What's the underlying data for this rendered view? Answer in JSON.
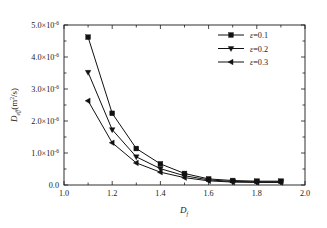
{
  "chart_data": {
    "type": "line",
    "title": "",
    "xlabel": "D_f",
    "ylabel": "D_eff(m^2/s)",
    "xlim": [
      1.0,
      2.0
    ],
    "ylim": [
      0.0,
      5e-06
    ],
    "grid": false,
    "legend_position": "top-right",
    "x": [
      1.1,
      1.2,
      1.3,
      1.4,
      1.5,
      1.6,
      1.7,
      1.8,
      1.9
    ],
    "xticks": [
      "1.0",
      "1.2",
      "1.4",
      "1.6",
      "1.8",
      "2.0"
    ],
    "xtick_values": [
      1.0,
      1.2,
      1.4,
      1.6,
      1.8,
      2.0
    ],
    "ytick_values": [
      0.0,
      1e-06,
      2e-06,
      3e-06,
      4e-06,
      5e-06
    ],
    "yticks": [
      {
        "mantissa": "0.0",
        "exponent": "",
        "times": ""
      },
      {
        "mantissa": "1.0",
        "exponent": "-6",
        "times": "×10"
      },
      {
        "mantissa": "2.0",
        "exponent": "-6",
        "times": "×10"
      },
      {
        "mantissa": "3.0",
        "exponent": "-6",
        "times": "×10"
      },
      {
        "mantissa": "4.0",
        "exponent": "-6",
        "times": "×10"
      },
      {
        "mantissa": "5.0",
        "exponent": "-6",
        "times": "×10"
      }
    ],
    "series": [
      {
        "name": "ε=0.1",
        "marker": "square",
        "values": [
          4.62e-06,
          2.24e-06,
          1.14e-06,
          6.6e-07,
          3.6e-07,
          1.9e-07,
          1.4e-07,
          1.2e-07,
          1.2e-07
        ]
      },
      {
        "name": "ε=0.2",
        "marker": "triangle-down",
        "values": [
          3.52e-06,
          1.73e-06,
          8.8e-07,
          5.1e-07,
          2.9e-07,
          1.6e-07,
          1.1e-07,
          1e-07,
          1e-07
        ]
      },
      {
        "name": "ε=0.3",
        "marker": "triangle-left",
        "values": [
          2.63e-06,
          1.32e-06,
          6.9e-07,
          4e-07,
          2.3e-07,
          1.3e-07,
          9e-08,
          8e-08,
          8e-08
        ]
      }
    ]
  },
  "axis": {
    "y_title_main": "D",
    "y_title_sub": "eff",
    "y_title_unit_open": "(m",
    "y_title_unit_sup": "2",
    "y_title_unit_close": "/s)",
    "x_title_main": "D",
    "x_title_sub": "f"
  },
  "legend": {
    "entries": [
      {
        "label": "ε=0.1",
        "marker": "square"
      },
      {
        "label": "ε=0.2",
        "marker": "triangle-down"
      },
      {
        "label": "ε=0.3",
        "marker": "triangle-left"
      }
    ]
  },
  "colors": {
    "line": "#111111",
    "frame": "#1a1a1a",
    "background": "#ffffff"
  }
}
